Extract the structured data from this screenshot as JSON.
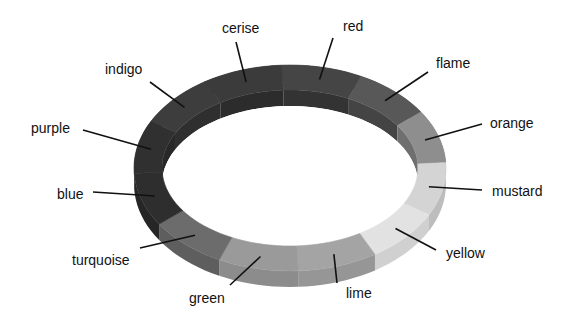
{
  "diagram": {
    "title": "",
    "type": "color-wheel-ring",
    "segments": [
      {
        "label": "cerise",
        "shade": "#3b3b3b",
        "side": "#2c2c2c"
      },
      {
        "label": "red",
        "shade": "#454545",
        "side": "#333333"
      },
      {
        "label": "flame",
        "shade": "#585858",
        "side": "#444444"
      },
      {
        "label": "orange",
        "shade": "#8e8e8e",
        "side": "#6f6f6f"
      },
      {
        "label": "mustard",
        "shade": "#d4d4d4",
        "side": "#bdbdbd"
      },
      {
        "label": "yellow",
        "shade": "#e2e2e2",
        "side": "#d0d0d0"
      },
      {
        "label": "lime",
        "shade": "#a4a4a4",
        "side": "#969696"
      },
      {
        "label": "green",
        "shade": "#9a9a9a",
        "side": "#8c8c8c"
      },
      {
        "label": "turquoise",
        "shade": "#6c6c6c",
        "side": "#5e5e5e"
      },
      {
        "label": "blue",
        "shade": "#2e2e2e",
        "side": "#262626"
      },
      {
        "label": "purple",
        "shade": "#303030",
        "side": "#282828"
      },
      {
        "label": "indigo",
        "shade": "#3d3d3d",
        "side": "#2f2f2f"
      }
    ]
  }
}
